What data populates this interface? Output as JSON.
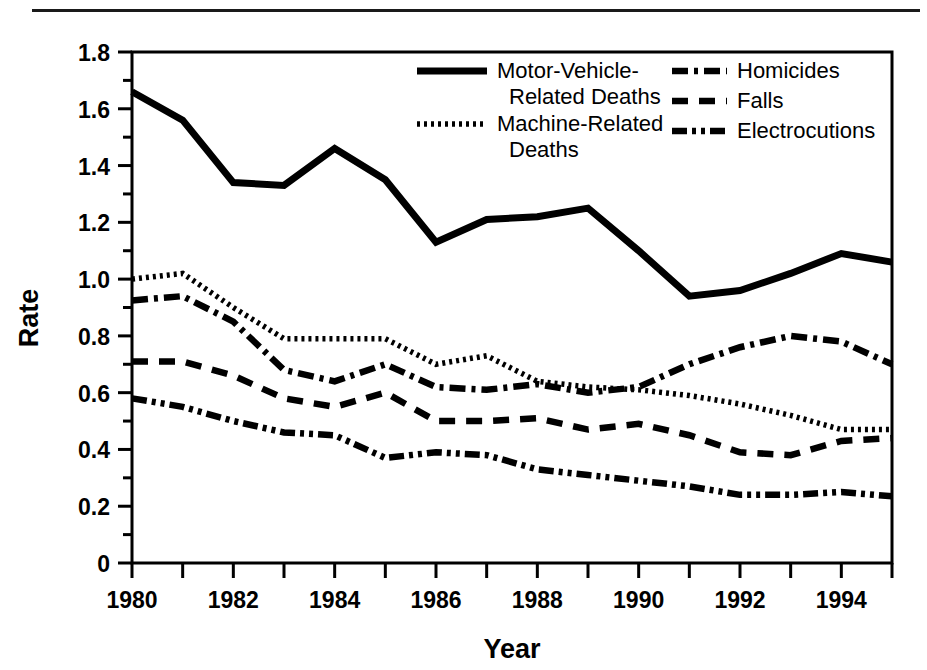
{
  "chart_data": {
    "type": "line",
    "title": "",
    "xlabel": "Year",
    "ylabel": "Rate",
    "xlim": [
      1980,
      1995
    ],
    "ylim": [
      0,
      1.8
    ],
    "ytick_values": [
      0,
      0.2,
      0.4,
      0.6,
      0.8,
      1.0,
      1.2,
      1.4,
      1.6,
      1.8
    ],
    "ytick_labels": [
      "0",
      "0.2",
      "0.4",
      "0.6",
      "0.8",
      "1.0",
      "1.2",
      "1.4",
      "1.6",
      "1.8"
    ],
    "yminor_step": 0.1,
    "xtick_values": [
      1980,
      1981,
      1982,
      1983,
      1984,
      1985,
      1986,
      1987,
      1988,
      1989,
      1990,
      1991,
      1992,
      1993,
      1994,
      1995
    ],
    "xtick_labels": [
      "1980",
      "",
      "1982",
      "",
      "1984",
      "",
      "1986",
      "",
      "1988",
      "",
      "1990",
      "",
      "1992",
      "",
      "1994",
      ""
    ],
    "xtick_labels_shown": [
      "1980",
      "1982",
      "1984",
      "1986",
      "1988",
      "1990",
      "1992",
      "1994"
    ],
    "grid": false,
    "legend_position": "top-center-inside",
    "x": [
      1980,
      1981,
      1982,
      1983,
      1984,
      1985,
      1986,
      1987,
      1988,
      1989,
      1990,
      1991,
      1992,
      1993,
      1994,
      1995
    ],
    "series": [
      {
        "name": "Motor-Vehicle-Related Deaths",
        "style": "solid",
        "color": "#000000",
        "values": [
          1.66,
          1.56,
          1.34,
          1.33,
          1.46,
          1.35,
          1.13,
          1.21,
          1.22,
          1.25,
          1.1,
          0.94,
          0.96,
          1.02,
          1.09,
          1.06
        ]
      },
      {
        "name": "Machine-Related Deaths",
        "style": "dotted",
        "color": "#000000",
        "values": [
          1.0,
          1.02,
          0.9,
          0.79,
          0.79,
          0.79,
          0.7,
          0.73,
          0.64,
          0.62,
          0.61,
          0.59,
          0.56,
          0.52,
          0.47,
          0.47
        ]
      },
      {
        "name": "Homicides",
        "style": "dash-dot",
        "color": "#000000",
        "values": [
          0.925,
          0.94,
          0.85,
          0.68,
          0.64,
          0.7,
          0.62,
          0.61,
          0.63,
          0.6,
          0.62,
          0.7,
          0.76,
          0.8,
          0.78,
          0.7
        ]
      },
      {
        "name": "Falls",
        "style": "dashed",
        "color": "#000000",
        "values": [
          0.71,
          0.71,
          0.66,
          0.58,
          0.55,
          0.6,
          0.5,
          0.5,
          0.51,
          0.47,
          0.49,
          0.45,
          0.39,
          0.38,
          0.43,
          0.44
        ]
      },
      {
        "name": "Electrocutions",
        "style": "dash-dot-dot",
        "color": "#000000",
        "values": [
          0.58,
          0.55,
          0.5,
          0.46,
          0.45,
          0.37,
          0.39,
          0.38,
          0.33,
          0.31,
          0.29,
          0.27,
          0.24,
          0.24,
          0.25,
          0.235
        ]
      }
    ],
    "legend_entries": [
      {
        "label_line1": "Motor-Vehicle-",
        "label_line2": "Related Deaths",
        "style": "solid"
      },
      {
        "label_line1": "Machine-Related",
        "label_line2": "Deaths",
        "style": "dotted"
      },
      {
        "label_line1": "Homicides",
        "label_line2": "",
        "style": "dash-dot"
      },
      {
        "label_line1": "Falls",
        "label_line2": "",
        "style": "dashed"
      },
      {
        "label_line1": "Electrocutions",
        "label_line2": "",
        "style": "dash-dot-dot"
      }
    ]
  },
  "axis": {
    "ylabel": "Rate",
    "xlabel": "Year"
  },
  "ticks": {
    "y": [
      "1.8",
      "1.6",
      "1.4",
      "1.2",
      "1.0",
      "0.8",
      "0.6",
      "0.4",
      "0.2",
      "0"
    ],
    "x": [
      "1980",
      "1982",
      "1984",
      "1986",
      "1988",
      "1990",
      "1992",
      "1994"
    ]
  },
  "legend": {
    "motor_vehicle_l1": "Motor-Vehicle-",
    "motor_vehicle_l2": "Related Deaths",
    "machine_l1": "Machine-Related",
    "machine_l2": "Deaths",
    "homicides": "Homicides",
    "falls": "Falls",
    "electrocutions": "Electrocutions"
  },
  "colors": {
    "ink": "#000000",
    "background": "#ffffff",
    "rule": "#1a1a1a"
  }
}
